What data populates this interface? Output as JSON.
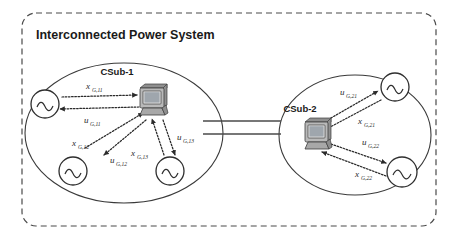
{
  "diagram": {
    "title": "Interconnected Power System",
    "subsystems": [
      {
        "id": "csub-1",
        "label": "CSub-1",
        "controller_icon": "computer-monitor-icon",
        "generators": [
          {
            "id": "gen-11",
            "icon": "ac-generator-icon"
          },
          {
            "id": "gen-12",
            "icon": "ac-generator-icon"
          },
          {
            "id": "gen-13",
            "icon": "ac-generator-icon"
          }
        ],
        "signals": [
          {
            "id": "x-g-11",
            "symbol": "x",
            "subscript": "G,11",
            "direction": "generator-to-controller"
          },
          {
            "id": "u-g-11",
            "symbol": "u",
            "subscript": "G,11",
            "direction": "controller-to-generator"
          },
          {
            "id": "x-g-12",
            "symbol": "x",
            "subscript": "G,12",
            "direction": "generator-to-controller"
          },
          {
            "id": "u-g-12",
            "symbol": "u",
            "subscript": "G,12",
            "direction": "controller-to-generator"
          },
          {
            "id": "x-g-13",
            "symbol": "x",
            "subscript": "G,13",
            "direction": "generator-to-controller"
          },
          {
            "id": "u-g-13",
            "symbol": "u",
            "subscript": "G,13",
            "direction": "controller-to-generator"
          }
        ]
      },
      {
        "id": "csub-2",
        "label": "CSub-2",
        "controller_icon": "computer-monitor-icon",
        "generators": [
          {
            "id": "gen-21",
            "icon": "ac-generator-icon"
          },
          {
            "id": "gen-22",
            "icon": "ac-generator-icon"
          }
        ],
        "signals": [
          {
            "id": "u-g-21",
            "symbol": "u",
            "subscript": "G,21",
            "direction": "controller-to-generator"
          },
          {
            "id": "x-g-21",
            "symbol": "x",
            "subscript": "G,21",
            "direction": "generator-to-controller"
          },
          {
            "id": "u-g-22",
            "symbol": "u",
            "subscript": "G,22",
            "direction": "controller-to-generator"
          },
          {
            "id": "x-g-22",
            "symbol": "x",
            "subscript": "G,22",
            "direction": "generator-to-controller"
          }
        ]
      }
    ],
    "tie_line": {
      "id": "tie-line",
      "conductors": 2
    },
    "colors": {
      "outer_border": "#4a4a4a",
      "ellipse_border": "#3a3a3a",
      "text": "#1a1a1a",
      "signal": "#2a2a2a",
      "background": "#ffffff"
    }
  }
}
